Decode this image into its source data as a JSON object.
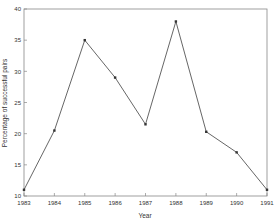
{
  "chart_data": {
    "type": "line",
    "title": "",
    "xlabel": "Year",
    "ylabel": "Percentage of successful pairs",
    "categories": [
      "1983",
      "1984",
      "1985",
      "1986",
      "1987",
      "1988",
      "1989",
      "1990",
      "1991"
    ],
    "x": [
      1983,
      1984,
      1985,
      1986,
      1987,
      1988,
      1989,
      1990,
      1991
    ],
    "values": [
      11,
      20.5,
      35,
      29,
      21.5,
      38,
      20.3,
      17,
      11
    ],
    "ylim": [
      10,
      40
    ],
    "xlim": [
      1983,
      1991
    ],
    "yticks": [
      10,
      15,
      20,
      25,
      30,
      35,
      40
    ],
    "xticks": [
      1983,
      1984,
      1985,
      1986,
      1987,
      1988,
      1989,
      1990,
      1991
    ],
    "grid": false,
    "legend": null,
    "markers": true
  },
  "colors": {
    "line": "#555555",
    "axis": "#888888",
    "marker": "#333333"
  }
}
